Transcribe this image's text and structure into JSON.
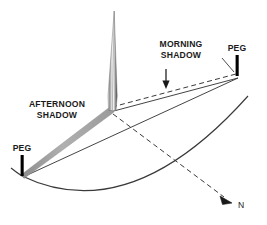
{
  "figure": {
    "type": "shadow-stick-north-finding-diagram",
    "background_color": "#ffffff",
    "line_color": "#333333",
    "text_color": "#1a1a1a",
    "shadow_band_color": "#a8a8a8",
    "peg_color": "#000000"
  },
  "labels": {
    "morning_shadow_line1": "MORNING",
    "morning_shadow_line2": "SHADOW",
    "afternoon_shadow_line1": "AFTERNOON",
    "afternoon_shadow_line2": "SHADOW",
    "peg_right": "PEG",
    "peg_left": "PEG",
    "north": "N"
  },
  "elements": {
    "gnomon": {
      "name": "gnomon-stick",
      "tip_x": 114,
      "tip_y": 12,
      "base_x": 110,
      "base_y": 110
    },
    "peg_right": {
      "name": "peg-right",
      "x": 237,
      "y_top": 55,
      "y_bottom": 76
    },
    "peg_left": {
      "name": "peg-left",
      "x": 22,
      "y_top": 155,
      "y_bottom": 176
    },
    "morning_shadow": {
      "style": "dashed",
      "from_x": 110,
      "from_y": 110,
      "to_x": 237,
      "to_y": 76
    },
    "afternoon_shadow": {
      "style": "solid-gray-band",
      "from_x": 110,
      "from_y": 110,
      "to_x": 22,
      "to_y": 176
    },
    "north_line": {
      "style": "dashed-with-arrowhead",
      "from_x": 110,
      "from_y": 110,
      "to_x": 226,
      "to_y": 198
    },
    "arc": {
      "style": "solid",
      "through_peg_left": true,
      "through_peg_right": true
    }
  }
}
